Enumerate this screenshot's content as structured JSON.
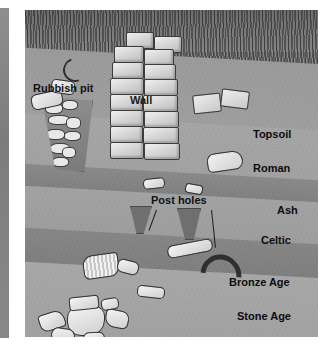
{
  "figure": {
    "type": "archaeological-stratigraphy-cross-section",
    "wall_label": "Wall",
    "rubbish_pit_label": "Rubbish pit",
    "post_holes_label": "Post holes"
  },
  "layers": [
    {
      "id": "topsoil",
      "label": "Topsoil",
      "tone": "#9b9b9b"
    },
    {
      "id": "roman",
      "label": "Roman",
      "tone": "#a6a6a6"
    },
    {
      "id": "ash",
      "label": "Ash",
      "tone": "#8a8a8a"
    },
    {
      "id": "celtic",
      "label": "Celtic",
      "tone": "#a3a3a3"
    },
    {
      "id": "bronze-age",
      "label": "Bronze Age",
      "tone": "#868686"
    },
    {
      "id": "stone-age",
      "label": "Stone Age",
      "tone": "#a8a8a8"
    }
  ],
  "colors": {
    "grass": "#6e6e6e",
    "stone": "#e4e4e4",
    "text": "#0d0d0d",
    "plate_background": "#9a9a9a"
  }
}
